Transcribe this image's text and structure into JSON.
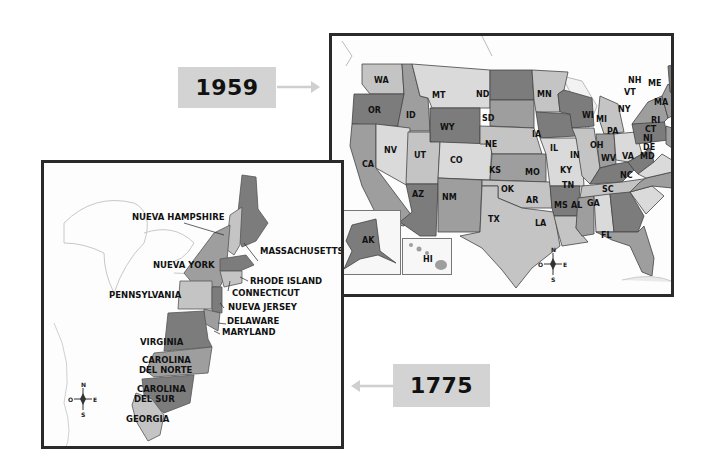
{
  "title_labels": {
    "year_1959": "1959",
    "year_1775": "1775"
  },
  "colors": {
    "year_box_bg": "#d3d3d3",
    "arrow": "#cfcfcf",
    "frame_border": "#2a2a2a",
    "shade_dark": "#7c7c7c",
    "shade_medium": "#9e9e9e",
    "shade_light": "#c4c4c4",
    "shade_lighter": "#dadada",
    "water": "#fdfdfd"
  },
  "map_1959": {
    "states": [
      "WA",
      "OR",
      "CA",
      "ID",
      "NV",
      "MT",
      "WY",
      "UT",
      "AZ",
      "CO",
      "NM",
      "ND",
      "SD",
      "NE",
      "KS",
      "OK",
      "TX",
      "MN",
      "IA",
      "MO",
      "AR",
      "LA",
      "WI",
      "IL",
      "MS",
      "MI",
      "IN",
      "KY",
      "TN",
      "AL",
      "OH",
      "WV",
      "VA",
      "NC",
      "SC",
      "GA",
      "FL",
      "PA",
      "NY",
      "VT",
      "NH",
      "ME",
      "MA",
      "RI",
      "CT",
      "NJ",
      "DE",
      "MD",
      "AK",
      "HI"
    ],
    "callout_labels": [
      "NH",
      "VT",
      "ME",
      "MA",
      "RI",
      "CT",
      "NJ",
      "DE",
      "MD"
    ],
    "compass": {
      "n": "N",
      "s": "S",
      "e": "E",
      "w": "O"
    }
  },
  "map_1775": {
    "colonies": [
      "NUEVA HAMPSHIRE",
      "MASSACHUSETTS",
      "NUEVA YORK",
      "RHODE ISLAND",
      "CONNECTICUT",
      "PENNSYLVANIA",
      "NUEVA JERSEY",
      "DELAWARE",
      "MARYLAND",
      "VIRGINIA",
      "CAROLINA DEL NORTE",
      "CAROLINA DEL SUR",
      "GEORGIA"
    ],
    "labels": {
      "nh": "NUEVA HAMPSHIRE",
      "ma": "MASSACHUSETTS",
      "ny": "NUEVA YORK",
      "ri": "RHODE ISLAND",
      "ct": "CONNECTICUT",
      "pa": "PENNSYLVANIA",
      "nj": "NUEVA JERSEY",
      "de": "DELAWARE",
      "md": "MARYLAND",
      "va": "VIRGINIA",
      "nc_1": "CAROLINA",
      "nc_2": "DEL NORTE",
      "sc_1": "CAROLINA",
      "sc_2": "DEL SUR",
      "ga": "GEORGIA"
    },
    "compass": {
      "n": "N",
      "s": "S",
      "e": "E",
      "w": "O"
    }
  }
}
